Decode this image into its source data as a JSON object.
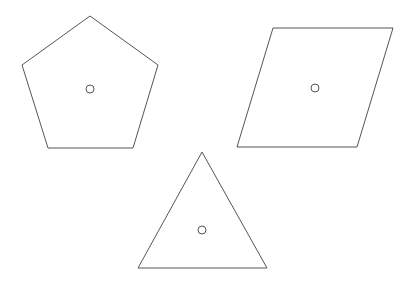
{
  "diagram": {
    "background": "#ffffff",
    "stroke_color": "#555555",
    "stroke_width": 1,
    "shapes": [
      {
        "name": "pentagon",
        "points": "90,16 158,65 133,148 48,148 22,65",
        "center": {
          "x": 90,
          "y": 89,
          "r": 4
        }
      },
      {
        "name": "parallelogram",
        "points": "273,28 393,28 357,147 237,147",
        "center": {
          "x": 315,
          "y": 88,
          "r": 4
        }
      },
      {
        "name": "triangle",
        "points": "202,152 267,268 138,268",
        "center": {
          "x": 202,
          "y": 230,
          "r": 4
        }
      }
    ]
  }
}
